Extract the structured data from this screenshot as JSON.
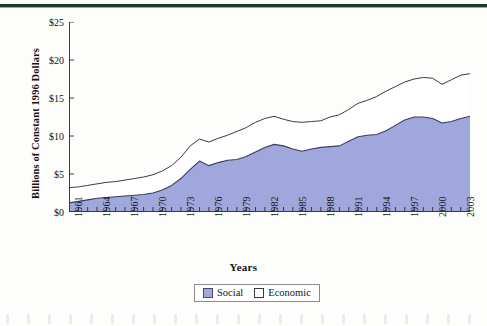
{
  "figure": {
    "background_color": "#fdfdfc",
    "top_rule_color": "#1d3b24"
  },
  "axes": {
    "y_title": "Billions of Constant 1996 Dollars",
    "x_title": "Years",
    "y_ticks": [
      "$0",
      "$5",
      "$10",
      "$15",
      "$20",
      "$25"
    ],
    "x_ticks": [
      "1961",
      "1964",
      "1967",
      "1970",
      "1973",
      "1976",
      "1979",
      "1982",
      "1985",
      "1988",
      "1991",
      "1994",
      "1997",
      "2000",
      "2003"
    ]
  },
  "legend": {
    "items": [
      {
        "label": "Social",
        "color": "#9fa7dc"
      },
      {
        "label": "Economic",
        "color": "#ffffff"
      }
    ]
  },
  "chart_data": {
    "type": "area",
    "stacked": true,
    "title": "",
    "subtitle": "",
    "xlabel": "Years",
    "ylabel": "Billions of Constant 1996 Dollars",
    "xlim": [
      1961,
      2004
    ],
    "ylim": [
      0,
      25
    ],
    "grid": false,
    "legend_position": "bottom-center",
    "y_tick_values": [
      0,
      5,
      10,
      15,
      20,
      25
    ],
    "y_tick_labels": [
      "$0",
      "$5",
      "$10",
      "$15",
      "$20",
      "$25"
    ],
    "x_tick_values": [
      1961,
      1964,
      1967,
      1970,
      1973,
      1976,
      1979,
      1982,
      1985,
      1988,
      1991,
      1994,
      1997,
      2000,
      2003
    ],
    "x": [
      1961,
      1962,
      1963,
      1964,
      1965,
      1966,
      1967,
      1968,
      1969,
      1970,
      1971,
      1972,
      1973,
      1974,
      1975,
      1976,
      1977,
      1978,
      1979,
      1980,
      1981,
      1982,
      1983,
      1984,
      1985,
      1986,
      1987,
      1988,
      1989,
      1990,
      1991,
      1992,
      1993,
      1994,
      1995,
      1996,
      1997,
      1998,
      1999,
      2000,
      2001,
      2002,
      2003,
      2004
    ],
    "series": [
      {
        "name": "Social",
        "color": "#9fa7dc",
        "line_color": "#3c3c5a",
        "values": [
          1.2,
          1.4,
          1.6,
          1.8,
          1.9,
          2.0,
          2.1,
          2.2,
          2.3,
          2.5,
          2.9,
          3.5,
          4.4,
          5.6,
          6.7,
          6.1,
          6.5,
          6.8,
          6.9,
          7.3,
          7.9,
          8.5,
          8.9,
          8.7,
          8.3,
          8.0,
          8.3,
          8.5,
          8.6,
          8.7,
          9.3,
          9.9,
          10.1,
          10.2,
          10.7,
          11.4,
          12.1,
          12.5,
          12.5,
          12.3,
          11.7,
          11.9,
          12.3,
          12.6
        ]
      },
      {
        "name": "Economic",
        "color": "#ffffff",
        "line_color": "#3c3c3c",
        "values": [
          2.0,
          1.9,
          1.9,
          1.9,
          2.0,
          2.0,
          2.1,
          2.2,
          2.3,
          2.4,
          2.5,
          2.6,
          2.8,
          3.1,
          2.9,
          3.1,
          3.2,
          3.3,
          3.7,
          3.8,
          3.9,
          3.8,
          3.7,
          3.5,
          3.6,
          3.8,
          3.6,
          3.5,
          3.9,
          4.1,
          4.2,
          4.4,
          4.6,
          5.0,
          5.2,
          5.1,
          5.0,
          5.0,
          5.2,
          5.3,
          5.1,
          5.5,
          5.7,
          5.6
        ]
      }
    ],
    "totals": [
      3.2,
      3.3,
      3.5,
      3.7,
      3.9,
      4.0,
      4.2,
      4.4,
      4.6,
      4.9,
      5.4,
      6.1,
      7.2,
      8.7,
      9.6,
      9.2,
      9.7,
      10.1,
      10.6,
      11.1,
      11.8,
      12.3,
      12.6,
      12.2,
      11.9,
      11.8,
      11.9,
      12.0,
      12.5,
      12.8,
      13.5,
      14.3,
      14.7,
      15.2,
      15.9,
      16.5,
      17.1,
      17.5,
      17.7,
      17.6,
      16.8,
      17.4,
      18.0,
      18.2
    ],
    "social_detail": {
      "1961": 1.2,
      "1974": 6.7,
      "1975": 6.1,
      "1983": 8.9,
      "1986": 8.0,
      "1994": 12.6,
      "1996": 11.8,
      "1998": 13.0,
      "2000": 15.5,
      "2001": 13.8,
      "2003": 18.1,
      "2004": 17.5
    },
    "total_detail": {
      "1961": 3.2,
      "1974": 9.7,
      "1975": 9.2,
      "1981": 12.4,
      "1984": 11.2,
      "1994": 17.0,
      "1996": 16.7,
      "1998": 18.3,
      "2000": 20.8,
      "2001": 19.5,
      "2003": 23.9,
      "2004": 22.6
    }
  }
}
